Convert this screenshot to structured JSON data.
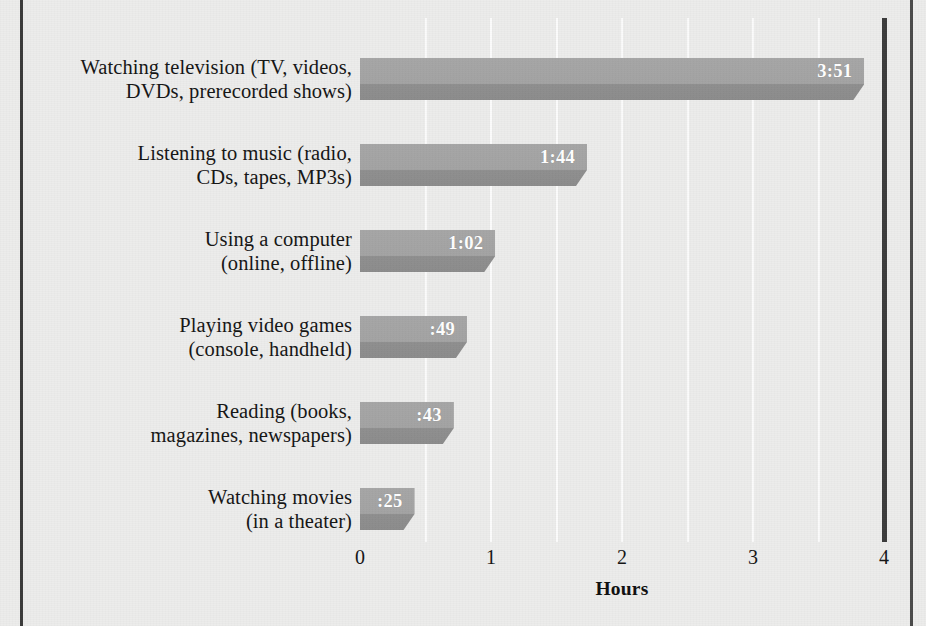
{
  "chart_data": {
    "type": "bar",
    "orientation": "horizontal",
    "title": "",
    "xlabel": "Hours",
    "ylabel": "",
    "xlim": [
      0,
      4
    ],
    "xticks": [
      0,
      1,
      2,
      3,
      4
    ],
    "xtick_labels": [
      "0",
      "1",
      "2",
      "3",
      "4"
    ],
    "grid": true,
    "grid_interval": 0.5,
    "legend": false,
    "categories": [
      "Watching television (TV, videos, DVDs, prerecorded shows)",
      "Listening to music (radio, CDs, tapes, MP3s)",
      "Using a computer (online, offline)",
      "Playing video games (console, handheld)",
      "Reading (books, magazines, newspapers)",
      "Watching movies (in a theater)"
    ],
    "values": [
      3.85,
      1.733,
      1.033,
      0.8167,
      0.7167,
      0.4167
    ],
    "value_labels": [
      "3:51",
      "1:44",
      "1:02",
      ":49",
      ":43",
      ":25"
    ]
  },
  "bars": [
    {
      "line1": "Watching television (TV, videos,",
      "line2": "DVDs, prerecorded shows)",
      "value_label": "3:51",
      "hours": 3.85
    },
    {
      "line1": "Listening to music (radio,",
      "line2": "CDs, tapes, MP3s)",
      "value_label": "1:44",
      "hours": 1.733
    },
    {
      "line1": "Using a computer",
      "line2": "(online, offline)",
      "value_label": "1:02",
      "hours": 1.033
    },
    {
      "line1": "Playing video games",
      "line2": "(console, handheld)",
      "value_label": ":49",
      "hours": 0.8167
    },
    {
      "line1": "Reading (books,",
      "line2": "magazines, newspapers)",
      "value_label": ":43",
      "hours": 0.7167
    },
    {
      "line1": "Watching movies",
      "line2": "(in a theater)",
      "value_label": ":25",
      "hours": 0.4167
    }
  ],
  "axis": {
    "title": "Hours",
    "ticks": [
      "0",
      "1",
      "2",
      "3",
      "4"
    ]
  },
  "colors": {
    "background": "#ececeb",
    "bar_top": "#a6a6a6",
    "bar_bottom": "#8c8c8c",
    "gridline": "#fbfbfb",
    "frame_rule": "#3b3b3b",
    "text": "#151515",
    "value_text": "#ffffff"
  }
}
